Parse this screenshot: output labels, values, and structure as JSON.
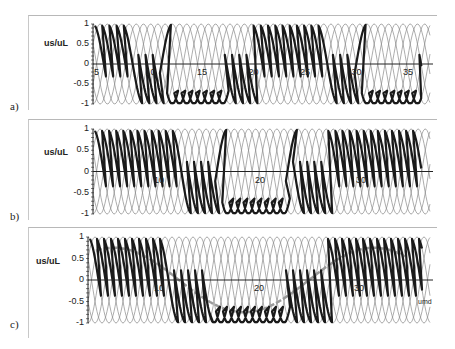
{
  "chart_data": [
    {
      "type": "line",
      "panel": "a)",
      "ylabel": "us/uL",
      "xlabel": "",
      "ylim": [
        -1,
        1
      ],
      "yticks": [
        1,
        0.5,
        0,
        -0.5,
        -1
      ],
      "xticks": [
        5,
        10,
        15,
        20,
        25,
        30,
        35
      ],
      "xlim": [
        4,
        36
      ],
      "series": [
        {
          "name": "envelope phase voltages",
          "style": "thin gray",
          "count": 6,
          "period_units": 4.2
        },
        {
          "name": "output voltage",
          "style": "thick black",
          "fundamental_period": 19,
          "amplitude": 0.9
        }
      ]
    },
    {
      "type": "line",
      "panel": "b)",
      "ylabel": "us/uL",
      "xlabel": "",
      "ylim": [
        -1,
        1
      ],
      "yticks": [
        1,
        0.5,
        0,
        -0.5,
        -1
      ],
      "xticks": [
        10,
        20,
        30
      ],
      "xlim": [
        2,
        36
      ],
      "series": [
        {
          "name": "envelope phase voltages",
          "style": "thin gray",
          "count": 6,
          "period_units": 4.2
        },
        {
          "name": "output voltage",
          "style": "thick black",
          "fundamental_period": 24,
          "amplitude": 0.85
        }
      ]
    },
    {
      "type": "line",
      "panel": "c)",
      "ylabel": "us/uL",
      "xlabel": "",
      "ylim": [
        -1,
        1
      ],
      "yticks": [
        1,
        0.5,
        0,
        -0.5,
        -1
      ],
      "xticks": [
        10,
        20,
        30
      ],
      "xlim": [
        2,
        36
      ],
      "annotations": [
        "umd"
      ],
      "series": [
        {
          "name": "envelope phase voltages",
          "style": "thin gray",
          "count": 6,
          "period_units": 4.2
        },
        {
          "name": "output voltage",
          "style": "thick black",
          "fundamental_period": 26,
          "amplitude": 0.85
        },
        {
          "name": "reference voltage umd",
          "style": "gray dashed thick",
          "fundamental_period": 26,
          "amplitude": 0.75
        }
      ]
    }
  ],
  "panels": [
    {
      "label": "a)",
      "ylabel": "us/uL",
      "yticks": [
        "1",
        "0.5",
        "0",
        "-0.5",
        "-1"
      ],
      "xticks": [
        "5",
        "10",
        "15",
        "20",
        "25",
        "30",
        "35"
      ]
    },
    {
      "label": "b)",
      "ylabel": "us/uL",
      "yticks": [
        "1",
        "0.5",
        "0",
        "-0.5",
        "-1"
      ],
      "xticks": [
        "10",
        "20",
        "30"
      ]
    },
    {
      "label": "c)",
      "ylabel": "us/uL",
      "yticks": [
        "1",
        "0.5",
        "0",
        "-0.5",
        "-1"
      ],
      "xticks": [
        "10",
        "20",
        "30"
      ],
      "annotation": "umd"
    }
  ],
  "colors": {
    "envelope": "#8a8a8a",
    "output": "#1a1a1a",
    "reference": "#9a9a9a",
    "axis": "#222222"
  }
}
